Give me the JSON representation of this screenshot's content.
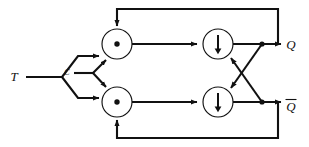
{
  "figure": {
    "background_color": "#ffffff",
    "line_color": "#111111",
    "width": 309,
    "height": 147
  },
  "inputs": [
    {
      "id": "t",
      "label": "T",
      "x": 14,
      "y": 77
    },
    {
      "id": "clock",
      "label": "C",
      "x": 66,
      "y": 72
    }
  ],
  "outputs": [
    {
      "id": "q",
      "label": "Q",
      "overbar": false,
      "x": 288,
      "y": 49
    },
    {
      "id": "qbar",
      "label": "Q",
      "overbar": true,
      "x": 288,
      "y": 107
    }
  ],
  "gates": [
    {
      "id": "and-top",
      "type": "and",
      "symbol": "dot",
      "cx": 117,
      "cy": 44,
      "r": 15
    },
    {
      "id": "and-bottom",
      "type": "and",
      "symbol": "dot",
      "cx": 117,
      "cy": 102,
      "r": 15
    },
    {
      "id": "nor-top",
      "type": "nor",
      "symbol": "down-arrow",
      "cx": 218,
      "cy": 44,
      "r": 15
    },
    {
      "id": "nor-bottom",
      "type": "nor",
      "symbol": "down-arrow",
      "cx": 218,
      "cy": 102,
      "r": 15
    }
  ],
  "nets": [
    {
      "id": "t-fanout",
      "from": "T",
      "to": [
        "and-top",
        "and-bottom"
      ]
    },
    {
      "id": "clock-fanout",
      "from": "C",
      "to": [
        "and-top",
        "and-bottom"
      ]
    },
    {
      "id": "and-top-to-nor-top",
      "from": "and-top",
      "to": "nor-top"
    },
    {
      "id": "and-bottom-to-nor-bottom",
      "from": "and-bottom",
      "to": "nor-bottom"
    },
    {
      "id": "cross-q-to-nor-bottom",
      "from": "q-junction",
      "to": "nor-bottom"
    },
    {
      "id": "cross-qbar-to-nor-top",
      "from": "qbar-junction",
      "to": "nor-top"
    },
    {
      "id": "feedback-top",
      "from": "q-junction",
      "to": "and-top"
    },
    {
      "id": "feedback-bottom",
      "from": "qbar-junction",
      "to": "and-bottom"
    }
  ],
  "legend": {
    "and_symbol_meaning": "AND (dot)",
    "nor_symbol_meaning": "NOR (Peirce arrow, down)"
  }
}
